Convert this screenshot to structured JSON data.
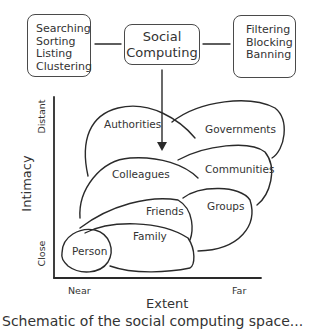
{
  "boxes": {
    "left": {
      "lines": [
        "Searching",
        "Sorting",
        "Listing",
        "Clustering"
      ]
    },
    "center": {
      "lines": [
        "Social",
        "Computing"
      ]
    },
    "right": {
      "lines": [
        "Filtering",
        "Blocking",
        "Banning"
      ]
    }
  },
  "axes": {
    "y_title": "Intimacy",
    "y_ticks": [
      "Distant",
      "Close"
    ],
    "x_title": "Extent",
    "x_ticks": [
      "Near",
      "Far"
    ]
  },
  "regions": [
    {
      "label": "Authorities"
    },
    {
      "label": "Governments"
    },
    {
      "label": "Colleagues"
    },
    {
      "label": "Communities"
    },
    {
      "label": "Friends"
    },
    {
      "label": "Groups"
    },
    {
      "label": "Family"
    },
    {
      "label": "Person"
    }
  ],
  "caption": "Schematic of the social computing space..."
}
